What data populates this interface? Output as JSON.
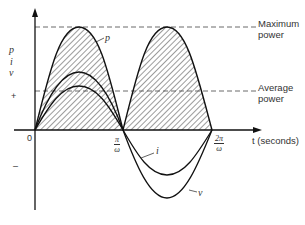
{
  "diagram": {
    "type": "waveform",
    "axis_labels": {
      "y_vars": [
        "p",
        "i",
        "v"
      ],
      "x": "t (seconds)",
      "origin": "0",
      "positive_sign": "+",
      "negative_sign": "–"
    },
    "ticks": [
      {
        "num": "π",
        "den": "ω"
      },
      {
        "num": "2π",
        "den": "ω"
      }
    ],
    "reference_lines": [
      {
        "label_line1": "Maximum",
        "label_line2": "power"
      },
      {
        "label_line1": "Average",
        "label_line2": "power"
      }
    ],
    "curve_labels": {
      "p": "p",
      "i": "i",
      "v": "v"
    }
  }
}
